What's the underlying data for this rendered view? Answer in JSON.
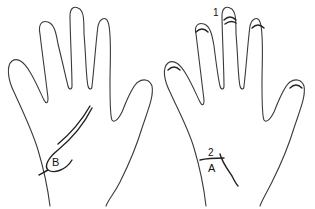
{
  "diagram": {
    "type": "hand-line-drawing",
    "panels": [
      {
        "id": "left-hand",
        "view": "palm",
        "labels": [
          {
            "text": "B",
            "role": "region-label"
          }
        ]
      },
      {
        "id": "right-hand",
        "view": "back",
        "labels": [
          {
            "text": "1",
            "role": "number-label"
          },
          {
            "text": "2",
            "role": "number-label"
          },
          {
            "text": "A",
            "role": "region-label"
          }
        ]
      }
    ],
    "colors": {
      "stroke": "#3a3a3a",
      "background": "#ffffff"
    }
  }
}
